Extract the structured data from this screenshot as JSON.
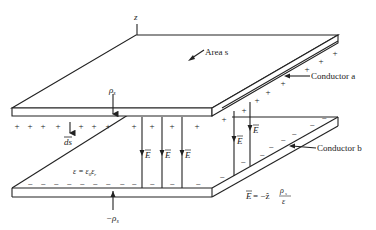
{
  "figure": {
    "labels": {
      "axis_z": "z",
      "area": "Area s",
      "conductor_a": "Conductor a",
      "conductor_b": "Conductor b",
      "rho_top": "ρ",
      "rho_top_sub": "s",
      "rho_bottom": "−ρ",
      "rho_bottom_sub": "s",
      "ds": "ds",
      "permittivity": "ε = ε",
      "permittivity_sub0": "0",
      "permittivity_er": "ε",
      "permittivity_subr": "r",
      "field_label": "E",
      "field_eq_lhs": "E",
      "field_eq_mid": " = −ẑ",
      "field_eq_num": "ρ",
      "field_eq_num_sub": "s",
      "field_eq_den": "ε"
    },
    "charges": {
      "top_plate": "+",
      "bottom_plate": "−"
    },
    "colors": {
      "ink": "#222222",
      "background": "#ffffff"
    }
  }
}
